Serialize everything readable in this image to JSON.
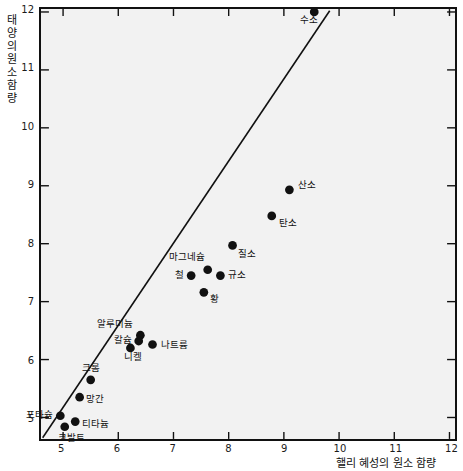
{
  "chart_data": {
    "type": "scatter",
    "title": "",
    "xlabel": "핼리 혜성의 원소 함량",
    "ylabel": "태양의 원소 함량",
    "ylabel_chars": [
      "태",
      "양",
      "의",
      "원",
      "소",
      "함",
      "량"
    ],
    "xlim": [
      4.6,
      12.1
    ],
    "ylim": [
      4.63,
      12.05
    ],
    "xticks": [
      5,
      6,
      7,
      8,
      9,
      10,
      11,
      12
    ],
    "yticks": [
      5,
      6,
      7,
      8,
      9,
      10,
      11,
      12
    ],
    "xtick_labels": [
      "5",
      "6",
      "7",
      "8",
      "9",
      "10",
      "11",
      "12"
    ],
    "ytick_labels": [
      "5",
      "6",
      "7",
      "8",
      "9",
      "10",
      "11",
      "12"
    ],
    "grid": false,
    "legend": "none",
    "background_color": "#f2f2f2",
    "point_color": "#111111",
    "line_color": "#111111",
    "trendline": {
      "x0": 4.63,
      "y0": 4.65,
      "x1": 9.83,
      "y1": 12.02
    },
    "points": [
      {
        "name": "수소",
        "x": 9.55,
        "y": 12.0,
        "label": "수소",
        "label_dx": -15,
        "label_dy": 10
      },
      {
        "name": "산소",
        "x": 9.1,
        "y": 8.93,
        "label": "산소",
        "label_dx": 8,
        "label_dy": -4
      },
      {
        "name": "탄소",
        "x": 8.78,
        "y": 8.48,
        "label": "탄소",
        "label_dx": 7,
        "label_dy": 7
      },
      {
        "name": "질소",
        "x": 8.07,
        "y": 7.97,
        "label": "질소",
        "label_dx": 6,
        "label_dy": 8
      },
      {
        "name": "마그네슘",
        "x": 7.62,
        "y": 7.55,
        "label": "마그네슘",
        "label_dx": -38,
        "label_dy": -13
      },
      {
        "name": "철",
        "x": 7.32,
        "y": 7.45,
        "label": "철",
        "label_dx": -16,
        "label_dy": -1
      },
      {
        "name": "규소",
        "x": 7.85,
        "y": 7.45,
        "label": "규소",
        "label_dx": 8,
        "label_dy": -1
      },
      {
        "name": "황",
        "x": 7.55,
        "y": 7.16,
        "label": "황",
        "label_dx": 7,
        "label_dy": 6
      },
      {
        "name": "알루미늄",
        "x": 6.4,
        "y": 6.42,
        "label": "알루미늄",
        "label_dx": -42,
        "label_dy": -12
      },
      {
        "name": "칼슘",
        "x": 6.37,
        "y": 6.32,
        "label": "칼슘",
        "label_dx": -24,
        "label_dy": -2
      },
      {
        "name": "니켈",
        "x": 6.22,
        "y": 6.2,
        "label": "니켈",
        "label_dx": -5,
        "label_dy": 8
      },
      {
        "name": "나트륨",
        "x": 6.62,
        "y": 6.26,
        "label": "나트륨",
        "label_dx": 9,
        "label_dy": -1
      },
      {
        "name": "크롬",
        "x": 5.5,
        "y": 5.65,
        "label": "크롬",
        "label_dx": -7,
        "label_dy": -13
      },
      {
        "name": "망간",
        "x": 5.3,
        "y": 5.35,
        "label": "망간",
        "label_dx": 8,
        "label_dy": 0
      },
      {
        "name": "포타슘",
        "x": 4.95,
        "y": 5.03,
        "label": "포타슘",
        "label_dx": -33,
        "label_dy": -3
      },
      {
        "name": "티타늄",
        "x": 5.22,
        "y": 4.93,
        "label": "티타늄",
        "label_dx": 8,
        "label_dy": 1
      },
      {
        "name": "코발트",
        "x": 5.03,
        "y": 4.84,
        "label": "코발트",
        "label_dx": -5,
        "label_dy": 9
      }
    ]
  }
}
